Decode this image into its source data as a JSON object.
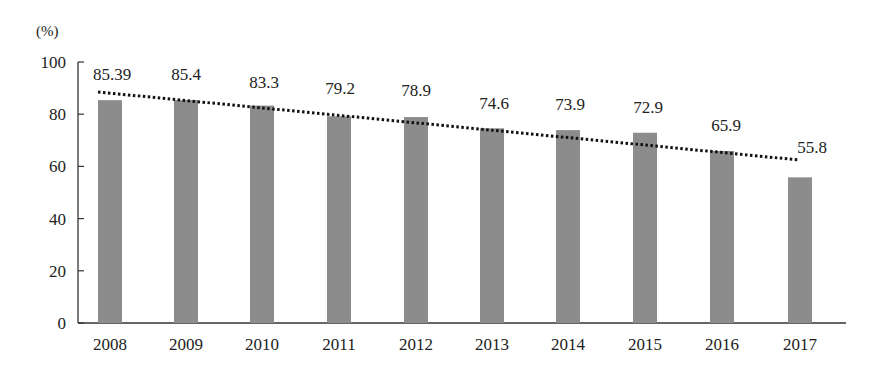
{
  "chart_data": {
    "type": "bar",
    "title": "",
    "unit_label": "(%)",
    "xlabel": "",
    "ylabel": "(%)",
    "ylim": [
      0,
      100
    ],
    "yticks": [
      0,
      20,
      40,
      60,
      80,
      100
    ],
    "categories": [
      "2008",
      "2009",
      "2010",
      "2011",
      "2012",
      "2013",
      "2014",
      "2015",
      "2016",
      "2017"
    ],
    "values": [
      85.39,
      85.4,
      83.3,
      79.2,
      78.9,
      74.6,
      73.9,
      72.9,
      65.9,
      55.8
    ],
    "data_labels": [
      "85.39",
      "85.4",
      "83.3",
      "79.2",
      "78.9",
      "74.6",
      "73.9",
      "72.9",
      "65.9",
      "55.8"
    ],
    "trendline": {
      "type": "linear",
      "style": "dotted",
      "start": 88.5,
      "end": 62.5
    },
    "grid": false,
    "legend": null,
    "colors": {
      "bar": "#8c8c8c",
      "trend": "#111111",
      "axis": "#333333"
    }
  }
}
